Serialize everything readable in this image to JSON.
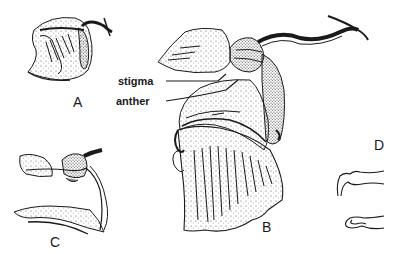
{
  "figure": {
    "panels": [
      {
        "id": "A",
        "label": "A",
        "description": "side view of whole flower on stalk"
      },
      {
        "id": "B",
        "label": "B",
        "description": "enlarged flower, lateral view with labelled parts"
      },
      {
        "id": "C",
        "label": "C",
        "description": "flower section showing column"
      },
      {
        "id": "D",
        "label": "D",
        "description": "two small detail outlines"
      }
    ],
    "callouts": {
      "stigma": "stigma",
      "anther": "anther"
    },
    "colors": {
      "ink": "#1a1a1a",
      "background": "#ffffff"
    }
  }
}
